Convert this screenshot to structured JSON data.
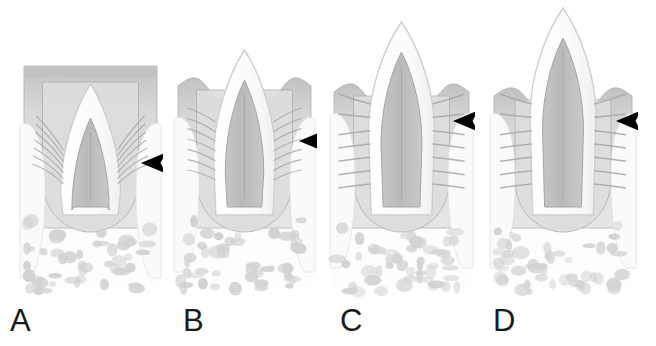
{
  "figure": {
    "background_color": "#ffffff",
    "marker_symbol": "arrowhead",
    "marker_color": "#000000",
    "marker_meaning": "black arrowhead indicating the dentogingival junction / epithelial attachment level",
    "panel_count": 4
  },
  "palette": {
    "background": "#ffffff",
    "gingiva_fill": "#d8d8d8",
    "gingiva_epithelium": "#c2c2c2",
    "gingiva_outline": "#b0b0b0",
    "enamel_fill": "#fbfbfb",
    "enamel_outline": "#cfcfcf",
    "dentin_pulp_fill": "#b9b9b9",
    "dentin_outline": "#a5a5a5",
    "fiber_stroke": "#a8a8a8",
    "bone_fill": "#fdfdfd",
    "trabeculae_fill": "#d2d2d2",
    "neighbor_tooth_fill": "#fafafa",
    "label_color": "#1a1a1a"
  },
  "panels": [
    {
      "id": "A",
      "label": "A",
      "label_x": 10,
      "label_y": 305,
      "stage": "Unerupted tooth fully covered by gingiva",
      "x": 18,
      "width": 145,
      "crown_exposed": false,
      "gingiva_top_y": 66,
      "crown_tip_y": 84,
      "arrowhead": {
        "x": 141,
        "y": 163,
        "direction": "left",
        "size": 25
      }
    },
    {
      "id": "B",
      "label": "B",
      "label_x": 183,
      "label_y": 305,
      "stage": "Crown tip piercing the gingival surface",
      "x": 172,
      "width": 145,
      "crown_exposed": true,
      "gingiva_top_y": 82,
      "crown_tip_y": 50,
      "arrowhead": {
        "x": 299,
        "y": 141,
        "direction": "left",
        "size": 25
      }
    },
    {
      "id": "C",
      "label": "C",
      "label_x": 340,
      "label_y": 305,
      "stage": "Crown partially erupted, gingival margin receding",
      "x": 328,
      "width": 147,
      "crown_exposed": true,
      "gingiva_top_y": 88,
      "crown_tip_y": 22,
      "arrowhead": {
        "x": 453,
        "y": 121,
        "direction": "left",
        "size": 25
      }
    },
    {
      "id": "D",
      "label": "D",
      "label_x": 493,
      "label_y": 305,
      "stage": "Crown fully erupted with mature periodontal ligament",
      "x": 488,
      "width": 150,
      "crown_exposed": true,
      "gingiva_top_y": 92,
      "crown_tip_y": 8,
      "arrowhead": {
        "x": 616,
        "y": 121,
        "direction": "left",
        "size": 25
      }
    }
  ],
  "structures": [
    {
      "name": "gingiva",
      "label": "Gingival connective tissue"
    },
    {
      "name": "oral-epithelium",
      "label": "Oral epithelium"
    },
    {
      "name": "enamel-crown",
      "label": "Enamel crown"
    },
    {
      "name": "dentin-pulp",
      "label": "Dentin and pulp"
    },
    {
      "name": "periodontal-fibers",
      "label": "Periodontal ligament fibers"
    },
    {
      "name": "alveolar-bone",
      "label": "Alveolar bone"
    },
    {
      "name": "trabeculae",
      "label": "Bone trabeculae"
    },
    {
      "name": "neighbor-tooth",
      "label": "Adjacent tooth"
    }
  ]
}
